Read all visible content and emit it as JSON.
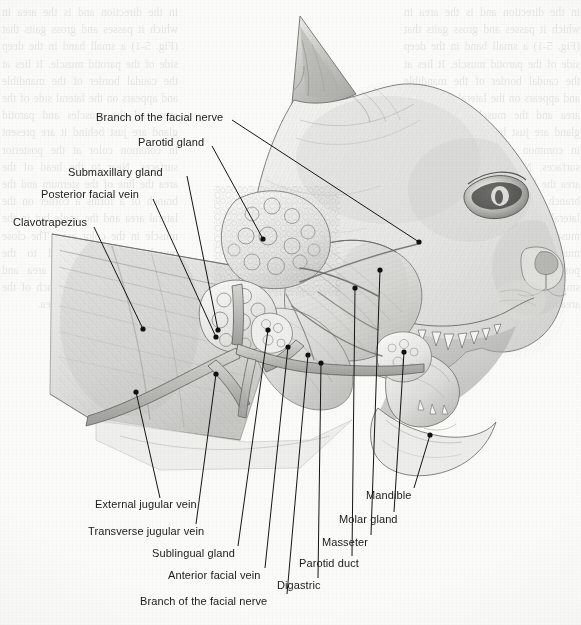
{
  "figure": {
    "background_color": "#fbfbfa",
    "ink_color": "#1b1b1b",
    "leader_dot_color": "#111111"
  },
  "labels": [
    {
      "id": "branch-facial-nerve-upper",
      "text": "Branch of the facial nerve",
      "text_x": 96,
      "text_y": 117,
      "anchor": "left",
      "line": {
        "x1": 232,
        "y1": 120,
        "x2": 419,
        "y2": 242
      },
      "dot": {
        "x": 419,
        "y": 242
      }
    },
    {
      "id": "parotid-gland",
      "text": "Parotid gland",
      "text_x": 138,
      "text_y": 142,
      "anchor": "left",
      "line": {
        "x1": 212,
        "y1": 146,
        "x2": 263,
        "y2": 239
      },
      "dot": {
        "x": 263,
        "y": 239
      }
    },
    {
      "id": "submaxillary-gland",
      "text": "Submaxillary gland",
      "text_x": 68,
      "text_y": 172,
      "anchor": "left",
      "line": {
        "x1": 187,
        "y1": 176,
        "x2": 218,
        "y2": 330
      },
      "dot": {
        "x": 218,
        "y": 330
      }
    },
    {
      "id": "posterior-facial-vein",
      "text": "Posterior facial vein",
      "text_x": 41,
      "text_y": 194,
      "anchor": "left",
      "line": {
        "x1": 153,
        "y1": 199,
        "x2": 216,
        "y2": 337
      },
      "dot": {
        "x": 216,
        "y": 337
      }
    },
    {
      "id": "clavotrapezius",
      "text": "Clavotrapezius",
      "text_x": 13,
      "text_y": 222,
      "anchor": "left",
      "line": {
        "x1": 94,
        "y1": 227,
        "x2": 143,
        "y2": 329
      },
      "dot": {
        "x": 143,
        "y": 329
      }
    },
    {
      "id": "external-jugular-vein",
      "text": "External jugular vein",
      "text_x": 95,
      "text_y": 504,
      "anchor": "left",
      "line": {
        "x1": 160,
        "y1": 498,
        "x2": 136,
        "y2": 392
      },
      "dot": {
        "x": 136,
        "y": 392
      }
    },
    {
      "id": "transverse-jugular-vein",
      "text": "Transverse jugular vein",
      "text_x": 88,
      "text_y": 531,
      "anchor": "left",
      "line": {
        "x1": 196,
        "y1": 524,
        "x2": 216,
        "y2": 374
      },
      "dot": {
        "x": 216,
        "y": 374
      }
    },
    {
      "id": "sublingual-gland",
      "text": "Sublingual gland",
      "text_x": 152,
      "text_y": 553,
      "anchor": "left",
      "line": {
        "x1": 238,
        "y1": 546,
        "x2": 268,
        "y2": 330
      },
      "dot": {
        "x": 268,
        "y": 330
      }
    },
    {
      "id": "anterior-facial-vein",
      "text": "Anterior facial vein",
      "text_x": 168,
      "text_y": 575,
      "anchor": "left",
      "line": {
        "x1": 265,
        "y1": 568,
        "x2": 288,
        "y2": 347
      },
      "dot": {
        "x": 288,
        "y": 347
      }
    },
    {
      "id": "branch-facial-nerve-lower",
      "text": "Branch of the facial nerve",
      "text_x": 140,
      "text_y": 601,
      "anchor": "left",
      "line": {
        "x1": 287,
        "y1": 594,
        "x2": 308,
        "y2": 355
      },
      "dot": {
        "x": 308,
        "y": 355
      }
    },
    {
      "id": "digastric",
      "text": "Digastric",
      "text_x": 277,
      "text_y": 585,
      "anchor": "left",
      "line": {
        "x1": 318,
        "y1": 578,
        "x2": 321,
        "y2": 363
      },
      "dot": {
        "x": 321,
        "y": 363
      }
    },
    {
      "id": "parotid-duct",
      "text": "Parotid duct",
      "text_x": 299,
      "text_y": 563,
      "anchor": "left",
      "line": {
        "x1": 352,
        "y1": 556,
        "x2": 355,
        "y2": 288
      },
      "dot": {
        "x": 355,
        "y": 288
      }
    },
    {
      "id": "masseter",
      "text": "Masseter",
      "text_x": 322,
      "text_y": 542,
      "anchor": "left",
      "line": {
        "x1": 371,
        "y1": 535,
        "x2": 380,
        "y2": 270
      },
      "dot": {
        "x": 380,
        "y": 270
      }
    },
    {
      "id": "molar-gland",
      "text": "Molar gland",
      "text_x": 339,
      "text_y": 519,
      "anchor": "left",
      "line": {
        "x1": 394,
        "y1": 512,
        "x2": 404,
        "y2": 352
      },
      "dot": {
        "x": 404,
        "y": 352
      }
    },
    {
      "id": "mandible",
      "text": "Mandible",
      "text_x": 366,
      "text_y": 495,
      "anchor": "left",
      "line": {
        "x1": 414,
        "y1": 488,
        "x2": 430,
        "y2": 435
      },
      "dot": {
        "x": 430,
        "y": 435
      }
    }
  ],
  "showthrough": {
    "left_column": "in the direction and is the area in which it passes and gross gaits that (Fig. 5-1) a small band in the deep side of the parotid muscle. It lies at the caudal border of the mandible and appears on the lateral side of the area and the muscles and parotid gland are just behind it are present in common color at the posterior surfaces. Near to the head of the area the line of the sternum and the branch of a forms a corner on the lateral area and the angle but in the muscle in the color area. The close muscle and is attached to the posterior branch of the area and small common to the branch of the area and common in the area.",
    "right_column": "in the direction and is the area in which it passes and gross gaits that (Fig. 5-1) a small band in the deep side of the parotid muscle. It lies at the caudal border of the mandible and appears on the lateral side of the area and the muscles and parotid gland are just behind it are present in common color at the posterior surfaces. Near to the head of the area the line of the sternum and the branch of a forms a corner on the lateral area and the angle but in the muscle in the color area. The close muscle and is attached to the posterior branch of the area and small common to the branch of the area and in the area."
  }
}
